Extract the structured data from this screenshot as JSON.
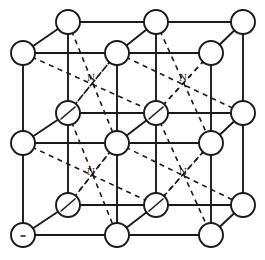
{
  "figure": {
    "kind": "crystal-structure-diagram",
    "canvas": {
      "width": 265,
      "height": 260,
      "background": "#ffffff"
    },
    "stroke_color": "#1a1a1a",
    "atom_fill": "#ffffff",
    "atom_radius": 12,
    "projection": {
      "type": "oblique-cabinet",
      "depth_offset_x": 45,
      "depth_offset_y": -30,
      "description": "back plane shifted right and up relative to front plane"
    },
    "grid": {
      "columns": 3,
      "rows": 3,
      "layers": 2,
      "front_x": [
        23,
        117,
        211
      ],
      "front_y": [
        53,
        143,
        235
      ],
      "back_x": [
        68,
        156,
        243
      ],
      "back_y": [
        22,
        113,
        205
      ]
    },
    "labels": {
      "interstitial": "N",
      "count": 4,
      "positions": [
        {
          "text": "N",
          "x": 91,
          "y": 78
        },
        {
          "text": "N",
          "x": 183,
          "y": 78
        },
        {
          "text": "N",
          "x": 91,
          "y": 172
        },
        {
          "text": "N",
          "x": 183,
          "y": 172
        }
      ]
    },
    "legend": {
      "atom_front_label": "front-plane lattice atom",
      "atom_back_label": "back-plane lattice atom",
      "solid_line_label": "front bond",
      "dashed_line_label": "hidden bond to interstitial site"
    },
    "counts": {
      "front_atoms": 9,
      "back_atoms": 9,
      "total_atoms": 18,
      "interstitial_sites": 4
    }
  }
}
